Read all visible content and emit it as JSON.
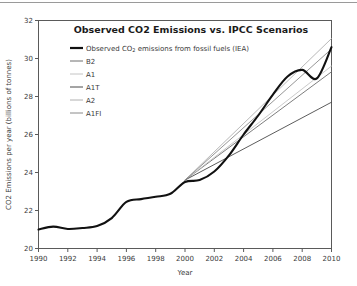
{
  "figure": {
    "background": "#ffffff",
    "frame_color": "#5a5a5a",
    "top_rule_color": "#9a9a9a"
  },
  "chart_data": {
    "type": "line",
    "title": "Observed CO2 Emissions vs. IPCC Scenarios",
    "xlabel": "Year",
    "ylabel": "CO2 Emissions per year (billions of tonnes)",
    "xlim": [
      1990,
      2010
    ],
    "ylim": [
      20,
      32
    ],
    "xticks": [
      1990,
      1992,
      1994,
      1996,
      1998,
      2000,
      2002,
      2004,
      2006,
      2008,
      2010
    ],
    "yticks": [
      20,
      22,
      24,
      26,
      28,
      30,
      32
    ],
    "xtick_labels": [
      "1990",
      "1992",
      "1994",
      "1996",
      "1998",
      "2000",
      "2002",
      "2004",
      "2006",
      "2008",
      "2010"
    ],
    "ytick_labels": [
      "20",
      "22",
      "24",
      "26",
      "28",
      "30",
      "32"
    ],
    "grid": false,
    "legend_position": "upper-left-inside",
    "series": [
      {
        "name": "Observed CO2 emissions from fossil fuels (IEA)",
        "legend_label_main": "Observed CO",
        "legend_label_sub": "2",
        "legend_label_rest": " emissions from fossil fuels (IEA)",
        "color": "#111111",
        "width": 2.1,
        "x": [
          1990,
          1991,
          1992,
          1993,
          1994,
          1995,
          1996,
          1997,
          1998,
          1999,
          2000,
          2001,
          2002,
          2003,
          2004,
          2005,
          2006,
          2007,
          2008,
          2009,
          2010
        ],
        "values": [
          21.0,
          21.15,
          21.03,
          21.08,
          21.18,
          21.6,
          22.45,
          22.6,
          22.72,
          22.88,
          23.5,
          23.6,
          24.05,
          24.9,
          26.0,
          27.0,
          28.1,
          29.05,
          29.4,
          28.95,
          30.6
        ]
      },
      {
        "name": "B2",
        "legend_label_main": "B2",
        "color": "#6e6e6e",
        "width": 0.9,
        "x": [
          2000,
          2010
        ],
        "values": [
          23.6,
          29.3
        ]
      },
      {
        "name": "A1",
        "legend_label_main": "A1",
        "color": "#c4c4c4",
        "width": 0.9,
        "x": [
          2000,
          2010
        ],
        "values": [
          23.6,
          29.6
        ]
      },
      {
        "name": "A1T",
        "legend_label_main": "A1T",
        "color": "#4a4a4a",
        "width": 0.9,
        "x": [
          2000,
          2010
        ],
        "values": [
          23.6,
          27.7
        ]
      },
      {
        "name": "A2",
        "legend_label_main": "A2",
        "color": "#b0b0b0",
        "width": 0.9,
        "x": [
          2000,
          2010
        ],
        "values": [
          23.6,
          31.05
        ]
      },
      {
        "name": "A1FI",
        "legend_label_main": "A1FI",
        "color": "#8a8a8a",
        "width": 0.9,
        "x": [
          2000,
          2010
        ],
        "values": [
          23.6,
          30.5
        ]
      }
    ]
  }
}
